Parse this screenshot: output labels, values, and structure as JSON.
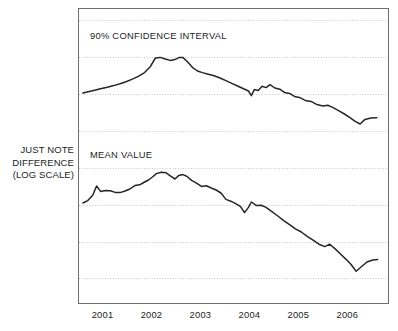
{
  "chart_data": {
    "type": "line",
    "title": "",
    "xlabel": "",
    "ylabel": "JUST NOTE DIFFERENCE (LOG SCALE)",
    "ylabel_lines": [
      "JUST NOTE",
      "DIFFERENCE",
      "(LOG SCALE)"
    ],
    "grid": true,
    "grid_style": "dotted-horizontal",
    "legend_position": "in-plot-annotation",
    "y_axis_ticks_labeled": false,
    "x_tick_labels": [
      "2001",
      "2002",
      "2003",
      "2004",
      "2005",
      "2006"
    ],
    "xlim": [
      2000.52,
      2006.85
    ],
    "ylim_note": "log scale, no numeric tick labels rendered",
    "series": [
      {
        "name": "90% CONFIDENCE INTERVAL",
        "annotation": "90% CONFIDENCE INTERVAL",
        "color": "#262626",
        "points": [
          [
            2000.62,
            93.0
          ],
          [
            2000.75,
            91.5
          ],
          [
            2000.88,
            90.0
          ],
          [
            2001.0,
            88.6
          ],
          [
            2001.12,
            87.2
          ],
          [
            2001.25,
            85.6
          ],
          [
            2001.38,
            83.8
          ],
          [
            2001.5,
            81.8
          ],
          [
            2001.62,
            79.4
          ],
          [
            2001.75,
            76.4
          ],
          [
            2001.88,
            72.6
          ],
          [
            2002.0,
            66.4
          ],
          [
            2002.1,
            58.0
          ],
          [
            2002.2,
            57.4
          ],
          [
            2002.3,
            59.0
          ],
          [
            2002.4,
            60.4
          ],
          [
            2002.5,
            59.6
          ],
          [
            2002.58,
            57.6
          ],
          [
            2002.66,
            57.4
          ],
          [
            2002.76,
            62.0
          ],
          [
            2002.86,
            67.6
          ],
          [
            2002.96,
            71.0
          ],
          [
            2003.06,
            72.6
          ],
          [
            2003.18,
            74.2
          ],
          [
            2003.3,
            75.8
          ],
          [
            2003.42,
            78.0
          ],
          [
            2003.54,
            80.6
          ],
          [
            2003.66,
            83.4
          ],
          [
            2003.78,
            86.0
          ],
          [
            2003.9,
            88.8
          ],
          [
            2004.0,
            91.0
          ],
          [
            2004.06,
            95.6
          ],
          [
            2004.12,
            89.6
          ],
          [
            2004.2,
            90.4
          ],
          [
            2004.28,
            86.2
          ],
          [
            2004.36,
            87.6
          ],
          [
            2004.44,
            84.6
          ],
          [
            2004.54,
            88.0
          ],
          [
            2004.64,
            89.2
          ],
          [
            2004.74,
            92.6
          ],
          [
            2004.84,
            93.4
          ],
          [
            2004.94,
            96.4
          ],
          [
            2005.04,
            97.4
          ],
          [
            2005.16,
            100.4
          ],
          [
            2005.28,
            101.4
          ],
          [
            2005.4,
            104.6
          ],
          [
            2005.52,
            106.0
          ],
          [
            2005.62,
            105.2
          ],
          [
            2005.72,
            107.4
          ],
          [
            2005.84,
            110.6
          ],
          [
            2005.96,
            114.0
          ],
          [
            2006.08,
            117.8
          ],
          [
            2006.18,
            121.4
          ],
          [
            2006.28,
            124.0
          ],
          [
            2006.38,
            119.4
          ],
          [
            2006.5,
            118.0
          ],
          [
            2006.62,
            117.8
          ]
        ]
      },
      {
        "name": "MEAN VALUE",
        "annotation": "MEAN VALUE",
        "color": "#262626",
        "points": [
          [
            2000.62,
            203.0
          ],
          [
            2000.72,
            200.6
          ],
          [
            2000.82,
            195.2
          ],
          [
            2000.9,
            186.0
          ],
          [
            2000.98,
            191.4
          ],
          [
            2001.08,
            190.4
          ],
          [
            2001.18,
            190.8
          ],
          [
            2001.28,
            192.4
          ],
          [
            2001.38,
            192.6
          ],
          [
            2001.48,
            191.0
          ],
          [
            2001.58,
            189.0
          ],
          [
            2001.68,
            185.6
          ],
          [
            2001.78,
            184.8
          ],
          [
            2001.88,
            182.0
          ],
          [
            2001.96,
            180.0
          ],
          [
            2002.04,
            177.0
          ],
          [
            2002.12,
            173.6
          ],
          [
            2002.22,
            172.2
          ],
          [
            2002.32,
            172.8
          ],
          [
            2002.42,
            176.4
          ],
          [
            2002.5,
            179.0
          ],
          [
            2002.58,
            175.4
          ],
          [
            2002.66,
            174.6
          ],
          [
            2002.74,
            176.2
          ],
          [
            2002.84,
            180.4
          ],
          [
            2002.94,
            183.2
          ],
          [
            2003.04,
            186.4
          ],
          [
            2003.14,
            185.8
          ],
          [
            2003.24,
            188.0
          ],
          [
            2003.34,
            190.0
          ],
          [
            2003.44,
            193.0
          ],
          [
            2003.54,
            199.4
          ],
          [
            2003.64,
            201.2
          ],
          [
            2003.74,
            203.6
          ],
          [
            2003.84,
            206.6
          ],
          [
            2003.92,
            212.6
          ],
          [
            2004.0,
            207.4
          ],
          [
            2004.06,
            202.0
          ],
          [
            2004.16,
            205.4
          ],
          [
            2004.26,
            205.2
          ],
          [
            2004.36,
            207.4
          ],
          [
            2004.48,
            211.6
          ],
          [
            2004.6,
            216.0
          ],
          [
            2004.72,
            220.6
          ],
          [
            2004.84,
            224.6
          ],
          [
            2004.96,
            228.8
          ],
          [
            2005.08,
            232.0
          ],
          [
            2005.2,
            236.4
          ],
          [
            2005.32,
            240.2
          ],
          [
            2005.44,
            244.2
          ],
          [
            2005.56,
            246.6
          ],
          [
            2005.66,
            244.2
          ],
          [
            2005.76,
            248.4
          ],
          [
            2005.88,
            254.0
          ],
          [
            2006.0,
            259.6
          ],
          [
            2006.1,
            264.8
          ],
          [
            2006.2,
            271.2
          ],
          [
            2006.3,
            267.0
          ],
          [
            2006.42,
            262.0
          ],
          [
            2006.54,
            260.0
          ],
          [
            2006.64,
            259.4
          ]
        ]
      }
    ],
    "gridlines_y": [
      20,
      57,
      94,
      131,
      168,
      205,
      242,
      278
    ]
  },
  "plot": {
    "frame": {
      "left": 78,
      "top": 8,
      "right": 388,
      "bottom": 303
    },
    "frame_color": "#6d6d6d",
    "gridline_color": "#c9c9c9",
    "background": "#ffffff"
  }
}
